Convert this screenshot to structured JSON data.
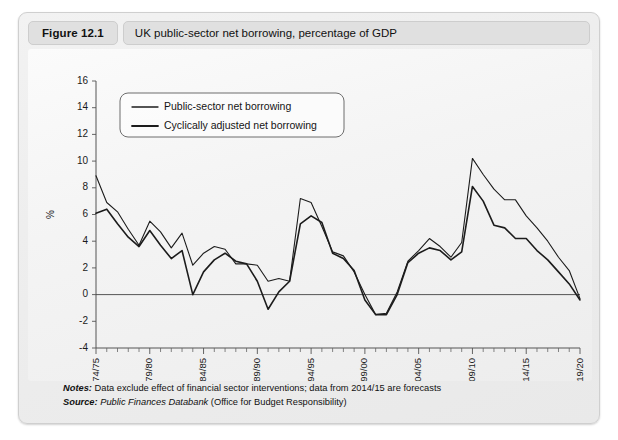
{
  "figure": {
    "number_label": "Figure 12.1",
    "title": "UK public-sector net borrowing, percentage of GDP"
  },
  "footnotes": {
    "notes_lead": "Notes:",
    "notes_text": " Data exclude effect of financial sector interventions; data from 2014/15 are forecasts",
    "source_lead": "Source:",
    "source_italic": " Public Finances Databank",
    "source_rest": " (Office for Budget Responsibility)"
  },
  "chart_data": {
    "type": "line",
    "title": "UK public-sector net borrowing, percentage of GDP",
    "xlabel": "",
    "ylabel": "%",
    "ylim": [
      -4,
      16
    ],
    "yticks": [
      16,
      14,
      12,
      10,
      8,
      6,
      4,
      2,
      0,
      -2,
      -4
    ],
    "grid": false,
    "legend_position": "top-left",
    "zero_reference_line": 0,
    "x": [
      "1974/75",
      "1975/76",
      "1976/77",
      "1977/78",
      "1978/79",
      "1979/80",
      "1980/81",
      "1981/82",
      "1982/83",
      "1983/84",
      "1984/85",
      "1985/86",
      "1986/87",
      "1987/88",
      "1988/89",
      "1989/90",
      "1990/91",
      "1991/92",
      "1992/93",
      "1993/94",
      "1994/95",
      "1995/96",
      "1996/97",
      "1997/98",
      "1998/99",
      "1999/00",
      "2000/01",
      "2001/02",
      "2002/03",
      "2003/04",
      "2004/05",
      "2005/06",
      "2006/07",
      "2007/08",
      "2008/09",
      "2009/10",
      "2010/11",
      "2011/12",
      "2012/13",
      "2013/14",
      "2014/15",
      "2015/16",
      "2016/17",
      "2017/18",
      "2018/19",
      "2019/20"
    ],
    "xtick_labels": [
      "1974/75",
      "1979/80",
      "1984/85",
      "1989/90",
      "1994/95",
      "1999/00",
      "2004/05",
      "2009/10",
      "2014/15",
      "2019/20"
    ],
    "xtick_indices": [
      0,
      5,
      10,
      15,
      20,
      25,
      30,
      35,
      40,
      45
    ],
    "series": [
      {
        "name": "Public-sector net borrowing",
        "stroke_width": 1.1,
        "color": "#1c1c1c",
        "values": [
          8.9,
          6.9,
          6.2,
          4.9,
          3.7,
          5.5,
          4.7,
          3.5,
          4.6,
          2.2,
          3.1,
          3.6,
          3.4,
          2.3,
          2.3,
          2.2,
          1.0,
          1.2,
          1.0,
          7.2,
          6.9,
          5.1,
          3.2,
          2.9,
          1.7,
          0.0,
          -1.5,
          -1.4,
          0.2,
          2.5,
          3.3,
          4.2,
          3.6,
          2.8,
          3.9,
          10.2,
          9.0,
          7.9,
          7.1,
          7.1,
          5.9,
          5.0,
          4.0,
          2.8,
          1.8,
          -0.3
        ]
      },
      {
        "name": "Cyclically adjusted net borrowing",
        "stroke_width": 1.6,
        "color": "#1c1c1c",
        "values": [
          6.1,
          6.4,
          5.3,
          4.3,
          3.6,
          4.8,
          3.7,
          2.7,
          3.3,
          0.0,
          1.7,
          2.6,
          3.1,
          2.5,
          2.3,
          1.0,
          -1.1,
          0.2,
          1.0,
          5.3,
          5.9,
          5.4,
          3.1,
          2.7,
          1.8,
          -0.4,
          -1.5,
          -1.5,
          0.0,
          2.4,
          3.1,
          3.5,
          3.3,
          2.6,
          3.2,
          8.1,
          7.0,
          5.2,
          5.0,
          4.2,
          4.2,
          3.3,
          2.6,
          1.7,
          0.8,
          -0.4
        ]
      }
    ]
  }
}
